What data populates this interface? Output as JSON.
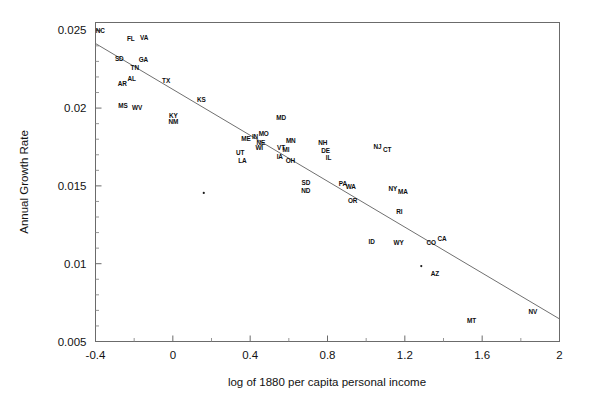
{
  "chart_data": {
    "type": "scatter",
    "title": "",
    "xlabel": "log of 1880 per capita personal income",
    "ylabel": "Annual Growth Rate",
    "xlim": [
      -0.4,
      2.0
    ],
    "ylim": [
      0.005,
      0.0255
    ],
    "xticks": [
      -0.4,
      0,
      0.4,
      0.8,
      1.2,
      1.6,
      2
    ],
    "xticklabels": [
      "-0.4",
      "0",
      "0.4",
      "0.8",
      "1.2",
      "1.6",
      "2"
    ],
    "xminorticks": [
      -0.2,
      0.2,
      0.6,
      1.0,
      1.4,
      1.8
    ],
    "yticks": [
      0.005,
      0.01,
      0.015,
      0.02,
      0.025
    ],
    "yticklabels": [
      "0.005",
      "0.01",
      "0.015",
      "0.02",
      "0.025"
    ],
    "yminorticks": [
      0.006,
      0.007,
      0.008,
      0.009,
      0.011,
      0.012,
      0.013,
      0.014,
      0.016,
      0.017,
      0.018,
      0.019,
      0.021,
      0.022,
      0.023,
      0.024
    ],
    "grid": false,
    "legend": null,
    "legend_position": "none",
    "frame": "box",
    "fit_line": {
      "label": "regression line",
      "x": [
        -0.4,
        2.0
      ],
      "y": [
        0.02415,
        0.00645
      ]
    },
    "point_label_type": "state-abbreviation",
    "points": [
      {
        "label": "NC",
        "x": -0.375,
        "y": 0.02485
      },
      {
        "label": "FL",
        "x": -0.218,
        "y": 0.0243
      },
      {
        "label": "VA",
        "x": -0.148,
        "y": 0.0244
      },
      {
        "label": "SD",
        "x": -0.277,
        "y": 0.02305
      },
      {
        "label": "GA",
        "x": -0.152,
        "y": 0.02295
      },
      {
        "label": "TN",
        "x": -0.197,
        "y": 0.02245
      },
      {
        "label": "AL",
        "x": -0.213,
        "y": 0.02175
      },
      {
        "label": "AR",
        "x": -0.262,
        "y": 0.02145
      },
      {
        "label": "TX",
        "x": -0.035,
        "y": 0.0216
      },
      {
        "label": "MS",
        "x": -0.258,
        "y": 0.02
      },
      {
        "label": "WV",
        "x": -0.185,
        "y": 0.01985
      },
      {
        "label": "KS",
        "x": 0.148,
        "y": 0.0204
      },
      {
        "label": "KY",
        "x": 0.003,
        "y": 0.01935
      },
      {
        "label": "NM",
        "x": 0.003,
        "y": 0.01895
      },
      {
        "label": "MD",
        "x": 0.56,
        "y": 0.01925
      },
      {
        "label": "ME",
        "x": 0.378,
        "y": 0.0179
      },
      {
        "label": "IN",
        "x": 0.425,
        "y": 0.018
      },
      {
        "label": "MO",
        "x": 0.47,
        "y": 0.0182
      },
      {
        "label": "NE",
        "x": 0.455,
        "y": 0.01765
      },
      {
        "label": "WI",
        "x": 0.447,
        "y": 0.0173
      },
      {
        "label": "MN",
        "x": 0.61,
        "y": 0.01775
      },
      {
        "label": "VT",
        "x": 0.56,
        "y": 0.0173
      },
      {
        "label": "MI",
        "x": 0.585,
        "y": 0.01715
      },
      {
        "label": "IA",
        "x": 0.553,
        "y": 0.0167
      },
      {
        "label": "OH",
        "x": 0.608,
        "y": 0.01645
      },
      {
        "label": "UT",
        "x": 0.348,
        "y": 0.017
      },
      {
        "label": "LA",
        "x": 0.36,
        "y": 0.01645
      },
      {
        "label": "NH",
        "x": 0.775,
        "y": 0.0176
      },
      {
        "label": "DE",
        "x": 0.79,
        "y": 0.0171
      },
      {
        "label": "IL",
        "x": 0.805,
        "y": 0.01665
      },
      {
        "label": "NJ",
        "x": 1.058,
        "y": 0.01735
      },
      {
        "label": "CT",
        "x": 1.108,
        "y": 0.0172
      },
      {
        "label": "SD",
        "x": 0.688,
        "y": 0.01505
      },
      {
        "label": "ND",
        "x": 0.688,
        "y": 0.01455
      },
      {
        "label": "PA",
        "x": 0.88,
        "y": 0.015
      },
      {
        "label": "WA",
        "x": 0.92,
        "y": 0.0148
      },
      {
        "label": "NY",
        "x": 1.138,
        "y": 0.01465
      },
      {
        "label": "MA",
        "x": 1.19,
        "y": 0.01445
      },
      {
        "label": "OR",
        "x": 0.93,
        "y": 0.0139
      },
      {
        "label": "RI",
        "x": 1.172,
        "y": 0.0132
      },
      {
        "label": "ID",
        "x": 1.028,
        "y": 0.01125
      },
      {
        "label": "WY",
        "x": 1.168,
        "y": 0.0112
      },
      {
        "label": "CO",
        "x": 1.337,
        "y": 0.0112
      },
      {
        "label": "CA",
        "x": 1.392,
        "y": 0.01145
      },
      {
        "label": "AZ",
        "x": 1.355,
        "y": 0.0092
      },
      {
        "label": "MT",
        "x": 1.545,
        "y": 0.0062
      },
      {
        "label": "NV",
        "x": 1.862,
        "y": 0.00675
      },
      {
        "label": "",
        "x": 0.16,
        "y": 0.01455
      },
      {
        "label": "",
        "x": 1.285,
        "y": 0.00985
      }
    ]
  },
  "axes": {
    "x_title": "log of 1880 per capita personal income",
    "y_title": "Annual Growth Rate"
  }
}
